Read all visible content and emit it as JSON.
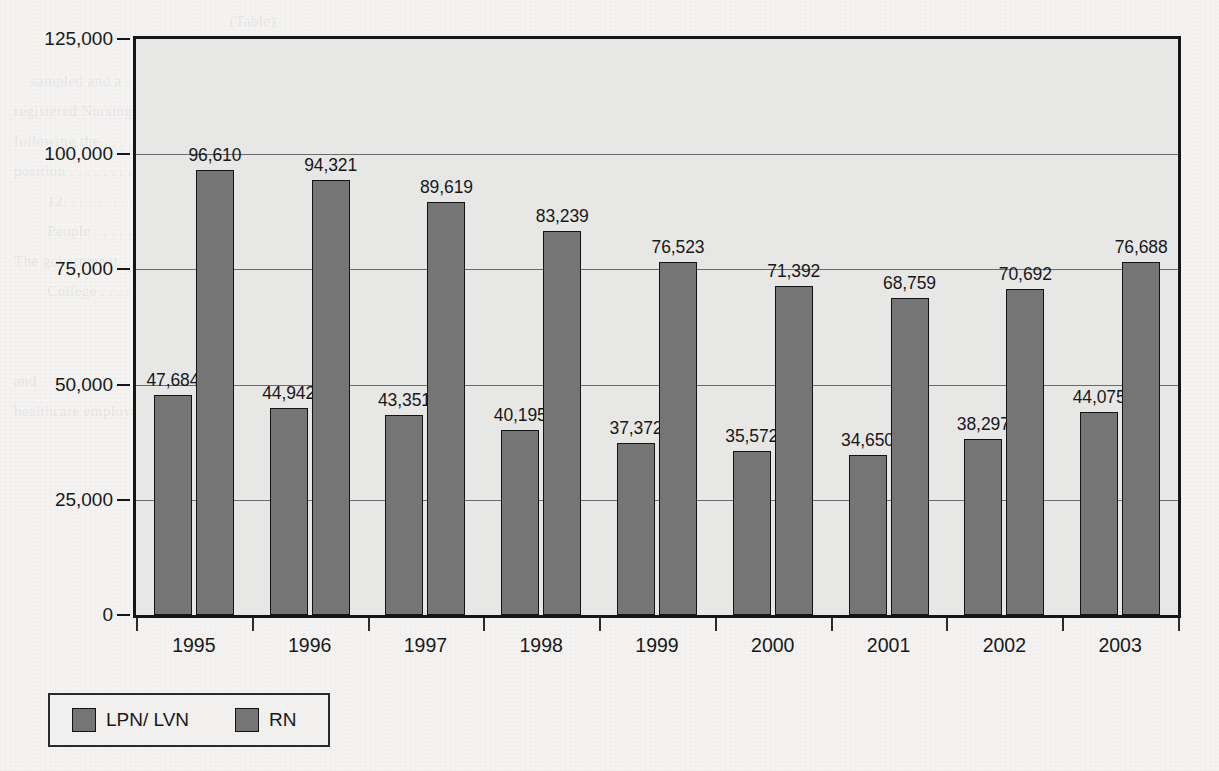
{
  "chart_data": {
    "type": "bar",
    "title": "",
    "subtitle": "",
    "xlabel": "",
    "ylabel": "",
    "categories": [
      "1995",
      "1996",
      "1997",
      "1998",
      "1999",
      "2000",
      "2001",
      "2002",
      "2003"
    ],
    "series": [
      {
        "name": "LPN/ LVN",
        "color": "#757576",
        "values": [
          47684,
          44942,
          43351,
          40195,
          37372,
          35572,
          34650,
          38297,
          44075
        ],
        "labels": [
          "47,684",
          "44,942",
          "43,351",
          "40,195",
          "37,372",
          "35,572",
          "34,650",
          "38,297",
          "44,075"
        ]
      },
      {
        "name": "RN",
        "color": "#757576",
        "values": [
          96610,
          94321,
          89619,
          83239,
          76523,
          71392,
          68759,
          70692,
          76688
        ],
        "labels": [
          "96,610",
          "94,321",
          "89,619",
          "83,239",
          "76,523",
          "71,392",
          "68,759",
          "70,692",
          "76,688"
        ]
      }
    ],
    "ylim": [
      0,
      125000
    ],
    "yticks": [
      0,
      25000,
      50000,
      75000,
      100000,
      125000
    ],
    "ytick_labels": [
      "0",
      "25,000",
      "50,000",
      "75,000",
      "100,000",
      "125,000"
    ],
    "grid": true,
    "grid_axis": "y",
    "legend_position": "below-left",
    "plot_background": "#e7e7e5",
    "page_background": "#f4f3f1",
    "frame_color": "#15161a"
  },
  "legend": {
    "entries": [
      {
        "label": "LPN/ LVN"
      },
      {
        "label": "RN"
      }
    ]
  },
  "ghost": {
    "lines": "                                                    (Table)\n                                                                                                            \n    sampled and a . . . . . . . . . . . . . . . . . . . . the position of staff hiring\nregistered Nursing School . . . . . . . . Hospitals and clinics with respect to employment in medical health\nfollowing the . . . . . Administration Theory\nposition . . . . . . . . . . . . . . . . . . . . . . . . . . . . . . . . . . . . . . . . . . .\n        12. . . . . . . . . . . . . . . . . . . . . Nursing  4. Approved . . . . . . . . . . . . . . . . . . . . . . . . . . . .\n        People . . . . . . . the computer . . . . . . . . . . . . . . . and as county, state and municipal\nThe government . . . . . . . . . . . . . . . . . . . . . of the said that . . . . . . . . . and schools\n        College . . . . . . . . . . . . . . . . . . . . . . . . . . . . . . . . . . . . . . . . . . . . . . . . .\n                                                                                                            \n                                                                                                            \nand . . . . . . . . . . . . . . . . . . . . . . . . . . . . . . . . . . . . . . . . . . . . . . . . . . . . . . . . .\nhealthcare employment . . . . . . . . . . . . . . . . . . . . . and nurses in the workforce by the\n"
  }
}
